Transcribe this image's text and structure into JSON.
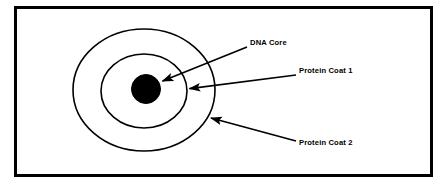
{
  "figure": {
    "background_color": "#ffffff",
    "border": {
      "color": "#000000",
      "width_px": 3,
      "x": 14,
      "y": 6,
      "width": 419,
      "height": 171
    },
    "stroke_color": "#000000",
    "fill_core_color": "#000000"
  },
  "shapes": [
    {
      "name": "protein-coat-2-ellipse",
      "kind": "ellipse",
      "cx": 144,
      "cy": 90,
      "rx": 71,
      "ry": 61,
      "fill": "none",
      "stroke": "#000000",
      "stroke_width": 1.6
    },
    {
      "name": "protein-coat-1-ellipse",
      "kind": "ellipse",
      "cx": 144,
      "cy": 91,
      "rx": 43,
      "ry": 37,
      "fill": "none",
      "stroke": "#000000",
      "stroke_width": 1.6
    },
    {
      "name": "dna-core-circle",
      "kind": "circle",
      "cx": 146,
      "cy": 89,
      "r": 14.5,
      "fill": "#000000",
      "stroke": "#000000",
      "stroke_width": 1
    }
  ],
  "annotations": [
    {
      "id": "dna-core",
      "label": "DNA Core",
      "label_x": 250,
      "label_y": 45,
      "arrow": {
        "from_x": 247,
        "from_y": 47,
        "to_x": 160,
        "to_y": 82
      }
    },
    {
      "id": "protein-coat-1",
      "label": "Protein Coat 1",
      "label_x": 299,
      "label_y": 73,
      "arrow": {
        "from_x": 296,
        "from_y": 75,
        "to_x": 187,
        "to_y": 89
      }
    },
    {
      "id": "protein-coat-2",
      "label": "Protein Coat 2",
      "label_x": 299,
      "label_y": 145,
      "arrow": {
        "from_x": 296,
        "from_y": 141,
        "to_x": 208,
        "to_y": 117
      }
    }
  ]
}
